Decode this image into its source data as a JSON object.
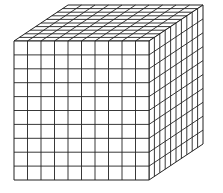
{
  "diagram": {
    "type": "cube-grid",
    "units_per_edge": 10,
    "geometry": {
      "front": {
        "x0": 14,
        "y0": 41,
        "x1": 149,
        "y1": 180
      },
      "depth_offset": {
        "dx": 54,
        "dy": -36
      }
    },
    "colors": {
      "fill": "#ffffff",
      "stroke": "#222222",
      "background": "#ffffff"
    }
  }
}
